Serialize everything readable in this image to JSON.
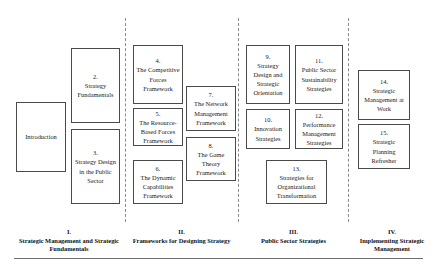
{
  "diagram": {
    "boxes": [
      {
        "key": "introduction",
        "num": "",
        "title": "Introduction"
      },
      {
        "key": "ch2",
        "num": "2.",
        "title": "Strategy Fundamentals"
      },
      {
        "key": "ch3",
        "num": "3.",
        "title": "Strategy Design in the Public Sector"
      },
      {
        "key": "ch4",
        "num": "4.",
        "title": "The Competitive Forces Framework"
      },
      {
        "key": "ch5",
        "num": "5.",
        "title": "The Resource-Based Forces Framework"
      },
      {
        "key": "ch6",
        "num": "6.",
        "title": "The Dynamic Capabilities Framework"
      },
      {
        "key": "ch7",
        "num": "7.",
        "title": "The Network Management Framework"
      },
      {
        "key": "ch8",
        "num": "8.",
        "title": "The Game Theory Framework"
      },
      {
        "key": "ch9",
        "num": "9.",
        "title": "Strategy Design and Strategic Orientation"
      },
      {
        "key": "ch10",
        "num": "10.",
        "title": "Innovation Strategies"
      },
      {
        "key": "ch11",
        "num": "11.",
        "title": "Public Sector Sustainability Strategies"
      },
      {
        "key": "ch12",
        "num": "12.",
        "title": "Performance Management Strategies"
      },
      {
        "key": "ch13",
        "num": "13.",
        "title": "Strategies for Organizational Transformation"
      },
      {
        "key": "ch14",
        "num": "14.",
        "title": "Strategic Management at Work"
      },
      {
        "key": "ch15",
        "num": "15.",
        "title": "Strategic Planning Refresher"
      }
    ],
    "sections": [
      {
        "key": "s1",
        "numeral": "I.",
        "name": "Strategic Management and Strategic Fundamentals"
      },
      {
        "key": "s2",
        "numeral": "II.",
        "name": "Frameworks for Designing Strategy"
      },
      {
        "key": "s3",
        "numeral": "III.",
        "name": "Public Sector Strategies"
      },
      {
        "key": "s4",
        "numeral": "IV.",
        "name": "Implementing Strategic Management"
      }
    ],
    "colors": {
      "box_border": "#4a4a4a",
      "divider": "#8a8a8a",
      "baseline": "#6d6d6d",
      "text": "#1a1a1a",
      "background": "#ffffff"
    }
  }
}
